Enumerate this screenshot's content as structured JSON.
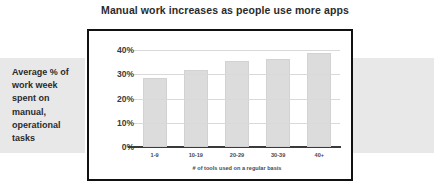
{
  "figure": {
    "title": "Manual work increases as people use more apps",
    "caption": "Average % of work week spent on manual, operational tasks"
  },
  "colors": {
    "band": "#e8e8e8",
    "bar": "#dcdcdc",
    "frame": "#111111",
    "grid": "#d9d9d9",
    "text": "#2b2b2b"
  },
  "chart_data": {
    "type": "bar",
    "title": "Manual work increases as people use more apps",
    "xlabel": "# of tools used on a regular basis",
    "ylabel": "",
    "categories": [
      "1-9",
      "10-19",
      "20-29",
      "30-39",
      "40+"
    ],
    "values": [
      28.5,
      32,
      35.5,
      36.3,
      39
    ],
    "ylim": [
      0,
      43
    ],
    "yticks": [
      0,
      10,
      20,
      30,
      40
    ],
    "ytick_labels": [
      "0%",
      "10%",
      "20%",
      "30%",
      "40%"
    ],
    "grid": true,
    "legend": "none"
  }
}
